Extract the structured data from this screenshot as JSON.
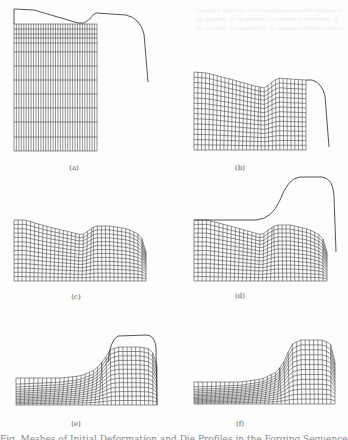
{
  "figure": {
    "panels": [
      {
        "id": "a",
        "label": "(a)",
        "label_pos": [
          74,
          164
        ],
        "mesh": {
          "x0": 14,
          "x1": 97,
          "bottom": 151,
          "cols": 34,
          "row_y_fracs": [
            0,
            0.039,
            0.079,
            0.11,
            0.15,
            0.22,
            0.331,
            0.441,
            0.551,
            0.661,
            0.772,
            0.89,
            1.0
          ],
          "top": [
            [
              14,
              24
            ],
            [
              97,
              24
            ]
          ],
          "skew": 0
        },
        "die": "M14,24 L14,9 L34,10 L78,23 L84,23 Q90,20 94,14 L97,13 L126,15 Q140,18 144,34 L148,82"
      },
      {
        "id": "b",
        "label": "(b)",
        "label_pos": [
          240,
          164
        ],
        "mesh": {
          "x0": 194,
          "x1": 306,
          "bottom": 150,
          "cols": 30,
          "rows": 15,
          "top": [
            [
              194,
              72
            ],
            [
              207,
              73
            ],
            [
              230,
              79
            ],
            [
              255,
              86
            ],
            [
              265,
              88
            ],
            [
              272,
              82
            ],
            [
              278,
              78
            ],
            [
              290,
              79
            ],
            [
              306,
              80
            ]
          ],
          "skew": 1
        },
        "die": "M306,80 L312,80 Q322,83 325,96 L329,147"
      },
      {
        "id": "c",
        "label": "(c)",
        "label_pos": [
          76,
          293
        ],
        "mesh": {
          "x0": 14,
          "x1": 146,
          "bottom": 281,
          "cols": 33,
          "rows": 14,
          "top": [
            [
              14,
              220
            ],
            [
              25,
              220
            ],
            [
              45,
              226
            ],
            [
              70,
              232
            ],
            [
              82,
              235
            ],
            [
              88,
              231
            ],
            [
              95,
              226
            ],
            [
              110,
              226
            ],
            [
              128,
              229
            ],
            [
              138,
              234
            ],
            [
              144,
              241
            ],
            [
              146,
              252
            ]
          ],
          "skew": 1
        },
        "die": ""
      },
      {
        "id": "d",
        "label": "(d)",
        "label_pos": [
          240,
          292
        ],
        "mesh": {
          "x0": 194,
          "x1": 327,
          "bottom": 281,
          "cols": 33,
          "rows": 14,
          "top": [
            [
              194,
              220
            ],
            [
              207,
              220
            ],
            [
              230,
              226
            ],
            [
              255,
              233
            ],
            [
              262,
              235
            ],
            [
              268,
              230
            ],
            [
              276,
              225
            ],
            [
              290,
              225
            ],
            [
              308,
              229
            ],
            [
              318,
              234
            ],
            [
              325,
              241
            ],
            [
              327,
              252
            ]
          ],
          "skew": 1
        },
        "die": "M194,220 L256,220 Q272,219 280,200 Q288,178 300,177 L322,177 Q333,178 334,196 L336,252"
      },
      {
        "id": "e",
        "label": "(e)",
        "label_pos": [
          76,
          420
        ],
        "mesh": {
          "x0": 16,
          "x1": 157,
          "bottom": 405,
          "cols": 34,
          "rows": 13,
          "top": [
            [
              16,
              378
            ],
            [
              60,
              378
            ],
            [
              80,
              376
            ],
            [
              95,
              370
            ],
            [
              104,
              360
            ],
            [
              110,
              350
            ],
            [
              118,
              347
            ],
            [
              140,
              347
            ],
            [
              150,
              349
            ],
            [
              155,
              356
            ],
            [
              157,
              365
            ]
          ],
          "skew": 2
        },
        "die": "M108,362 Q110,340 118,336 L146,335 Q155,335 156,348 L157,405"
      },
      {
        "id": "f",
        "label": "(f)",
        "label_pos": [
          240,
          420
        ],
        "mesh": {
          "x0": 194,
          "x1": 335,
          "bottom": 404,
          "cols": 34,
          "rows": 13,
          "top": [
            [
              194,
              382
            ],
            [
              240,
              382
            ],
            [
              262,
              379
            ],
            [
              277,
              372
            ],
            [
              285,
              360
            ],
            [
              291,
              345
            ],
            [
              300,
              340
            ],
            [
              322,
              340
            ],
            [
              330,
              343
            ],
            [
              334,
              352
            ],
            [
              335,
              362
            ]
          ],
          "skew": 2
        },
        "die": ""
      }
    ],
    "stroke_color": "#3a3a3a",
    "die_color": "#2a2a2a"
  },
  "caption": {
    "text": "Fig. Meshes of Initial Deformation and Die Profiles in the Forging Sequence, (a)-(f)"
  },
  "bleed_through": {
    "text": "Cavitation Reactions in the forming process; the influence of die geometry on the material flow pattern and the filling of the die cavity is examined for the sequence of meshes shown."
  }
}
